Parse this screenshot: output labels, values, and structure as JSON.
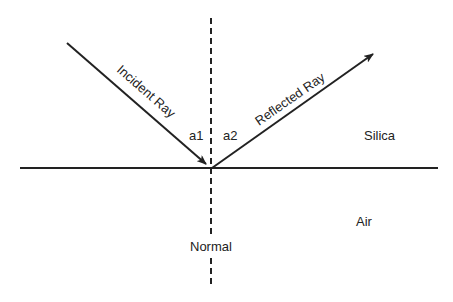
{
  "labels": {
    "incident_ray": "Incident Ray",
    "reflected_ray": "Reflected Ray",
    "angle_incident": "a1",
    "angle_reflected": "a2",
    "medium_top": "Silica",
    "medium_bottom": "Air",
    "normal": "Normal"
  },
  "colors": {
    "line": "#222222",
    "background": "#ffffff"
  }
}
